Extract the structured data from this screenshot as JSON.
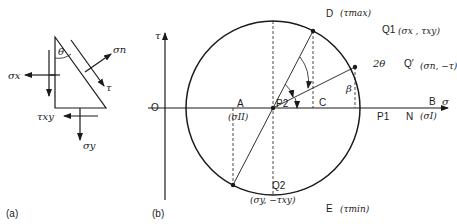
{
  "panel_a": {
    "caption": "(a)",
    "angle_label": "θ",
    "sigma_n": "σn",
    "tau": "τ",
    "sigma_x": "σx",
    "tau_xy": "τxy",
    "sigma_y": "σy"
  },
  "panel_b": {
    "caption": "(b)",
    "axis_tau": "τ",
    "axis_sigma": "σ",
    "origin": "O",
    "A": "A",
    "A_value": "(σII)",
    "P2": "P2",
    "C": "C",
    "P1": "P1",
    "N": "N",
    "B": "B",
    "B_value": "(σI)",
    "D": "D",
    "D_value": "(τmax)",
    "E": "E",
    "E_value": "(τmin)",
    "Q1": "Q1",
    "Q1_value": "(σx , τxy)",
    "Qp": "Q′",
    "Qp_value": "(σn, −τ)",
    "Q2": "Q2",
    "Q2_value": "(σy, −τxy)",
    "angle_2theta": "2θ",
    "angle_beta": "β"
  }
}
